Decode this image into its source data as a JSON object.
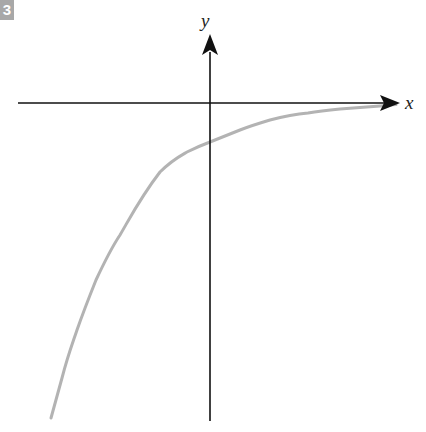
{
  "figure": {
    "number_badge": "3",
    "x_axis_label": "x",
    "y_axis_label": "y"
  },
  "colors": {
    "axis": "#111111",
    "curve": "#b3b3b3",
    "badge_bg": "#a8a8a8"
  },
  "curve": {
    "description": "Decreasing-magnitude exponential-like curve below x-axis, approaching x-axis asymptotically as x increases; crosses y-axis below origin",
    "shape": "y = -a·e^(-kx) style, horizontal asymptote y = 0"
  }
}
